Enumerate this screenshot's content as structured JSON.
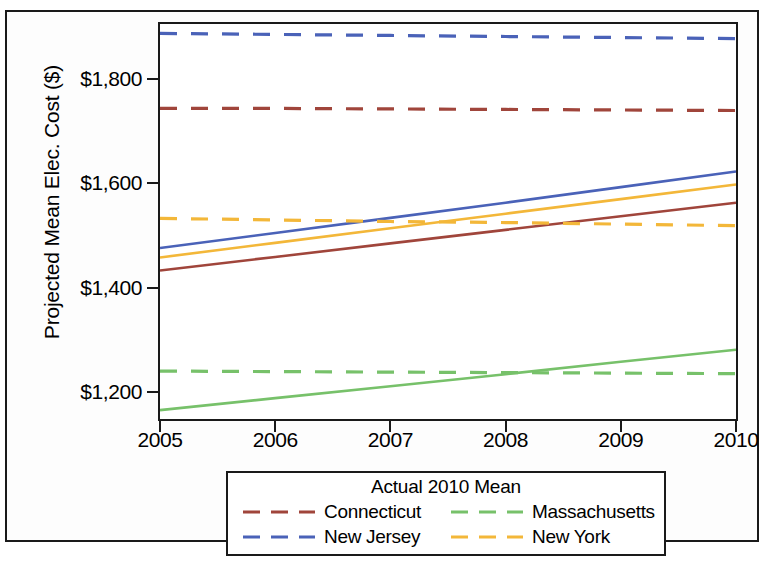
{
  "chart_data": {
    "type": "line",
    "title": "",
    "xlabel": "",
    "ylabel": "Projected Mean Elec. Cost ($)",
    "x": [
      2005,
      2006,
      2007,
      2008,
      2009,
      2010
    ],
    "xticklabels": [
      "2005",
      "2006",
      "2007",
      "2008",
      "2009",
      "2010"
    ],
    "yticklabels": [
      "$1,200",
      "$1,400",
      "$1,600",
      "$1,800"
    ],
    "ytickvalues": [
      1200,
      1400,
      1600,
      1800
    ],
    "xlim": [
      2005,
      2010
    ],
    "ylim": [
      1148,
      1906
    ],
    "grid": false,
    "legend_position": "below",
    "series": [
      {
        "name": "Connecticut",
        "style": "solid",
        "color": "#A0453B",
        "values": [
          1433,
          1459,
          1485,
          1511,
          1537,
          1563
        ]
      },
      {
        "name": "Connecticut",
        "style": "dashed",
        "color": "#A0453B",
        "label_group": "Actual 2010 Mean",
        "values": [
          1744,
          1744,
          1743,
          1742,
          1741,
          1740
        ]
      },
      {
        "name": "Massachusetts",
        "style": "solid",
        "color": "#77C16A",
        "values": [
          1165,
          1188,
          1211,
          1234,
          1258,
          1281
        ]
      },
      {
        "name": "Massachusetts",
        "style": "dashed",
        "color": "#77C16A",
        "label_group": "Actual 2010 Mean",
        "values": [
          1240,
          1239,
          1238,
          1237,
          1236,
          1235
        ]
      },
      {
        "name": "New Jersey",
        "style": "solid",
        "color": "#4A62B8",
        "values": [
          1476,
          1505,
          1534,
          1563,
          1593,
          1623
        ]
      },
      {
        "name": "New Jersey",
        "style": "dashed",
        "color": "#4A62B8",
        "label_group": "Actual 2010 Mean",
        "values": [
          1888,
          1886,
          1884,
          1882,
          1880,
          1878
        ]
      },
      {
        "name": "New York",
        "style": "solid",
        "color": "#F3B739",
        "values": [
          1458,
          1486,
          1514,
          1542,
          1570,
          1598
        ]
      },
      {
        "name": "New York",
        "style": "dashed",
        "color": "#F3B739",
        "label_group": "Actual 2010 Mean",
        "values": [
          1533,
          1530,
          1527,
          1525,
          1522,
          1519
        ]
      }
    ]
  },
  "axis": {
    "y_title": "Projected Mean Elec. Cost ($)",
    "y_ticks": [
      {
        "label": "$1,800",
        "value": 1800
      },
      {
        "label": "$1,600",
        "value": 1600
      },
      {
        "label": "$1,400",
        "value": 1400
      },
      {
        "label": "$1,200",
        "value": 1200
      }
    ],
    "x_ticks": [
      {
        "label": "2005",
        "value": 2005
      },
      {
        "label": "2006",
        "value": 2006
      },
      {
        "label": "2007",
        "value": 2007
      },
      {
        "label": "2008",
        "value": 2008
      },
      {
        "label": "2009",
        "value": 2009
      },
      {
        "label": "2010",
        "value": 2010
      }
    ]
  },
  "legend": {
    "title": "Actual 2010 Mean",
    "entries": [
      {
        "label": "Connecticut",
        "color": "#A0453B",
        "style": "dashed"
      },
      {
        "label": "Massachusetts",
        "color": "#77C16A",
        "style": "dashed"
      },
      {
        "label": "New Jersey",
        "color": "#4A62B8",
        "style": "dashed"
      },
      {
        "label": "New York",
        "color": "#F3B739",
        "style": "dashed"
      }
    ]
  }
}
